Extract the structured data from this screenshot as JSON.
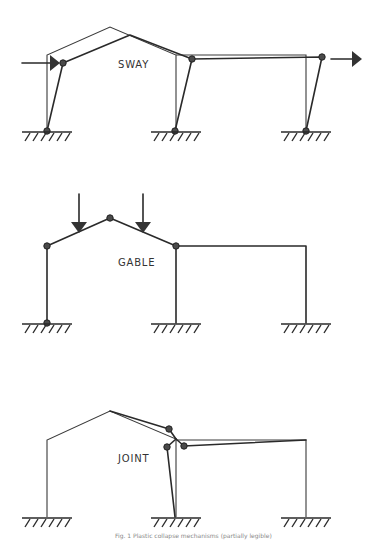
{
  "figure": {
    "panels": [
      {
        "id": "sway",
        "label": "SWAY"
      },
      {
        "id": "gable",
        "label": "GABLE"
      },
      {
        "id": "joint",
        "label": "JOINT"
      }
    ],
    "caption": "Fig. 1 Plastic collapse mechanisms (partially legible)",
    "colors": {
      "line": "#2a2a2a",
      "hinge": "#4a4a4a",
      "background": "#ffffff"
    }
  }
}
